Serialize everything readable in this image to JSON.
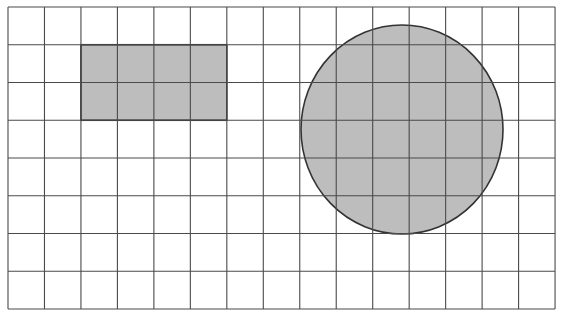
{
  "diagram": {
    "type": "grid-with-shapes",
    "grid": {
      "columns": 15,
      "rows": 8,
      "origin": [
        8,
        7
      ],
      "cell_width": 36.47,
      "cell_height": 37.75,
      "line_color": "#4a4a4a",
      "background": "#ffffff"
    },
    "shapes": [
      {
        "kind": "rectangle",
        "label": "shaded-rectangle",
        "grid_col": 2,
        "grid_row": 1,
        "width_cells": 4,
        "height_cells": 2,
        "fill": "#bdbdbd",
        "stroke": "#333333"
      },
      {
        "kind": "circle",
        "label": "shaded-circle",
        "cx": 402,
        "cy": 129.5,
        "rx": 101,
        "ry": 104.5,
        "fill": "#bdbdbd",
        "stroke": "#333333"
      }
    ]
  }
}
